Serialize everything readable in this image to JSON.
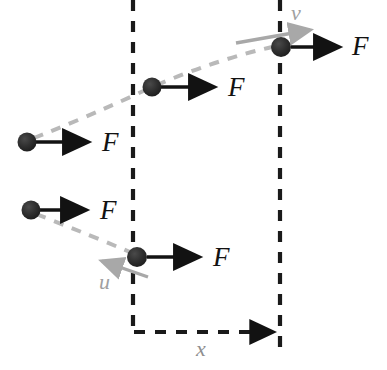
{
  "figure": {
    "type": "physics-free-body-diagram",
    "background_color": "#ffffff",
    "colors": {
      "ball": "#2b2b2b",
      "force_arrow": "#121212",
      "velocity_arrow": "#a8a8a8",
      "trajectory": "#b9b9b9",
      "boundary_line": "#1a1a1a",
      "velocity_label": "#a0a0a0",
      "distance_label": "#8f8f8f",
      "force_label": "#121212"
    }
  },
  "boundaries": [
    {
      "name": "left-boundary",
      "x": 133,
      "y1": 0,
      "y2": 334
    },
    {
      "name": "right-boundary",
      "x": 280,
      "y1": 0,
      "y2": 352
    }
  ],
  "displacement": {
    "label": "x",
    "label_x": 196,
    "label_y": 338,
    "from_x": 133,
    "to_x": 281,
    "y": 332
  },
  "velocities": [
    {
      "name": "final-velocity",
      "label": "v",
      "label_x": 291,
      "label_y": 2,
      "x1": 236,
      "y1": 43,
      "x2": 316,
      "y2": 29
    },
    {
      "name": "initial-velocity",
      "label": "u",
      "label_x": 99,
      "label_y": 271,
      "x1": 148,
      "y1": 277,
      "x2": 97,
      "y2": 259
    }
  ],
  "particles": [
    {
      "name": "particle-upper-start",
      "cx": 27,
      "cy": 142,
      "r": 9,
      "force_label": "F",
      "force_x1": 36,
      "force_y1": 142,
      "force_x2": 94,
      "force_y2": 142,
      "label_x": 102,
      "label_y": 129
    },
    {
      "name": "particle-upper-middle",
      "cx": 152,
      "cy": 87,
      "r": 9,
      "force_label": "F",
      "force_x1": 161,
      "force_y1": 87,
      "force_x2": 220,
      "force_y2": 87,
      "label_x": 228,
      "label_y": 74
    },
    {
      "name": "particle-upper-end",
      "cx": 281,
      "cy": 47,
      "r": 10,
      "force_label": "F",
      "force_x1": 291,
      "force_y1": 47,
      "force_x2": 345,
      "force_y2": 47,
      "label_x": 352,
      "label_y": 33
    },
    {
      "name": "particle-lower-start",
      "cx": 31,
      "cy": 210,
      "r": 9,
      "force_label": "F",
      "force_x1": 40,
      "force_y1": 210,
      "force_x2": 92,
      "force_y2": 210,
      "label_x": 100,
      "label_y": 197
    },
    {
      "name": "particle-lower-end",
      "cx": 137,
      "cy": 257,
      "r": 10,
      "force_label": "F",
      "force_x1": 147,
      "force_y1": 257,
      "force_x2": 205,
      "force_y2": 257,
      "label_x": 213,
      "label_y": 244
    }
  ],
  "trajectories": [
    {
      "name": "upper-trajectory",
      "path": "M 34 138 Q 90 116 152 87 Q 215 60 272 47"
    },
    {
      "name": "lower-trajectory",
      "path": "M 36 214 Q 90 235 137 255"
    }
  ]
}
